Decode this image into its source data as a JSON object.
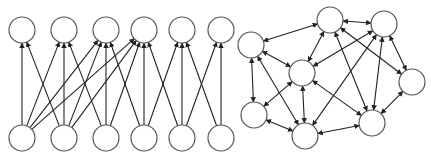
{
  "diagram": {
    "colors": {
      "node_stroke": "#555555",
      "node_fill": "#ffffff",
      "edge": "#222222",
      "background": "#ffffff"
    },
    "node_radius": 13,
    "left_graph": {
      "type": "bipartite-layered",
      "nodes": [
        {
          "id": "T0",
          "x": 22,
          "y": 30
        },
        {
          "id": "T1",
          "x": 64,
          "y": 30
        },
        {
          "id": "T2",
          "x": 106,
          "y": 30
        },
        {
          "id": "T3",
          "x": 144,
          "y": 30
        },
        {
          "id": "T4",
          "x": 182,
          "y": 30
        },
        {
          "id": "T5",
          "x": 221,
          "y": 30
        },
        {
          "id": "B0",
          "x": 22,
          "y": 138
        },
        {
          "id": "B1",
          "x": 64,
          "y": 138
        },
        {
          "id": "B2",
          "x": 106,
          "y": 138
        },
        {
          "id": "B3",
          "x": 144,
          "y": 138
        },
        {
          "id": "B4",
          "x": 182,
          "y": 138
        },
        {
          "id": "B5",
          "x": 221,
          "y": 138
        }
      ],
      "edges": [
        [
          "B0",
          "T0"
        ],
        [
          "B0",
          "T1"
        ],
        [
          "B0",
          "T2"
        ],
        [
          "B0",
          "T3"
        ],
        [
          "B1",
          "T0"
        ],
        [
          "B1",
          "T1"
        ],
        [
          "B1",
          "T2"
        ],
        [
          "B1",
          "T3"
        ],
        [
          "B2",
          "T1"
        ],
        [
          "B2",
          "T2"
        ],
        [
          "B2",
          "T3"
        ],
        [
          "B3",
          "T2"
        ],
        [
          "B3",
          "T3"
        ],
        [
          "B3",
          "T4"
        ],
        [
          "B4",
          "T3"
        ],
        [
          "B4",
          "T4"
        ],
        [
          "B4",
          "T5"
        ],
        [
          "B5",
          "T4"
        ],
        [
          "B5",
          "T5"
        ]
      ],
      "directed": "one-way"
    },
    "right_graph": {
      "type": "general-network",
      "nodes": [
        {
          "id": "A",
          "x": 330,
          "y": 20
        },
        {
          "id": "B",
          "x": 384,
          "y": 24
        },
        {
          "id": "C",
          "x": 251,
          "y": 45
        },
        {
          "id": "D",
          "x": 302,
          "y": 73
        },
        {
          "id": "E",
          "x": 412,
          "y": 82
        },
        {
          "id": "F",
          "x": 254,
          "y": 115
        },
        {
          "id": "G",
          "x": 305,
          "y": 136
        },
        {
          "id": "H",
          "x": 372,
          "y": 123
        }
      ],
      "edges": [
        [
          "A",
          "B"
        ],
        [
          "A",
          "C"
        ],
        [
          "A",
          "D"
        ],
        [
          "A",
          "E"
        ],
        [
          "A",
          "H"
        ],
        [
          "B",
          "D"
        ],
        [
          "B",
          "E"
        ],
        [
          "B",
          "H"
        ],
        [
          "B",
          "G"
        ],
        [
          "C",
          "D"
        ],
        [
          "C",
          "F"
        ],
        [
          "C",
          "G"
        ],
        [
          "D",
          "F"
        ],
        [
          "D",
          "G"
        ],
        [
          "D",
          "H"
        ],
        [
          "E",
          "H"
        ],
        [
          "F",
          "G"
        ],
        [
          "G",
          "H"
        ]
      ],
      "directed": "two-way"
    }
  }
}
